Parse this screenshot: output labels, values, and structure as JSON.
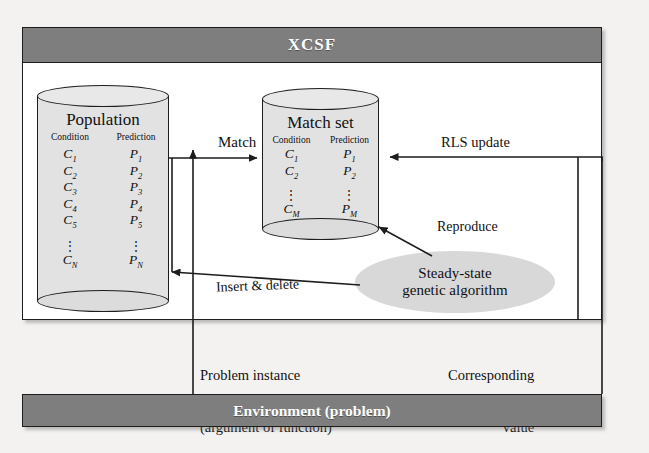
{
  "diagram": {
    "xcsf": {
      "label": "XCSF"
    },
    "environment": {
      "label": "Environment (problem)"
    },
    "population": {
      "title": "Population",
      "col_condition": "Condition",
      "col_prediction": "Prediction",
      "rows": [
        {
          "condition": "C",
          "csub": "1",
          "prediction": "P",
          "psub": "1"
        },
        {
          "condition": "C",
          "csub": "2",
          "prediction": "P",
          "psub": "2"
        },
        {
          "condition": "C",
          "csub": "3",
          "prediction": "P",
          "psub": "3"
        },
        {
          "condition": "C",
          "csub": "4",
          "prediction": "P",
          "psub": "4"
        },
        {
          "condition": "C",
          "csub": "5",
          "prediction": "P",
          "psub": "5"
        }
      ],
      "ellipsis": "⋮",
      "last": {
        "condition": "C",
        "csub": "N",
        "prediction": "P",
        "psub": "N"
      }
    },
    "match_set": {
      "title": "Match set",
      "col_condition": "Condition",
      "col_prediction": "Prediction",
      "rows": [
        {
          "condition": "C",
          "csub": "1",
          "prediction": "P",
          "psub": "1"
        },
        {
          "condition": "C",
          "csub": "2",
          "prediction": "P",
          "psub": "2"
        }
      ],
      "ellipsis": "⋮",
      "last": {
        "condition": "C",
        "csub": "M",
        "prediction": "P",
        "psub": "M"
      }
    },
    "ga": {
      "line1": "Steady-state",
      "line2": "genetic algorithm"
    },
    "labels": {
      "match": "Match",
      "rls_update": "RLS update",
      "reproduce": "Reproduce",
      "insert_delete": "Insert & delete",
      "problem_instance_l1": "Problem instance",
      "problem_instance_l2": "(argument of function)",
      "corresponding_l1": "Corresponding",
      "corresponding_l2": "value"
    },
    "colors": {
      "bar_gray": "#7e7e7e",
      "cylinder_fill": "#e2e2e2",
      "ellipse_fill": "#d8d8d8",
      "line": "#1d1d1d",
      "page_bg": "#f3f2f0",
      "panel_bg": "#ffffff",
      "bar_text": "#ffffff"
    }
  }
}
